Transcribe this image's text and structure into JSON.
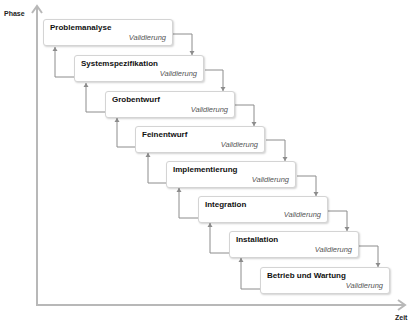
{
  "axes": {
    "y_label": "Phase",
    "x_label": "Zeit",
    "color": "#b3b3b3"
  },
  "connector_color": "#8c8c8c",
  "phases": [
    {
      "title": "Problemanalyse",
      "subtitle": "Validierung"
    },
    {
      "title": "Systemspezifikation",
      "subtitle": "Validierung"
    },
    {
      "title": "Grobentwurf",
      "subtitle": "Validierung"
    },
    {
      "title": "Feinentwurf",
      "subtitle": "Validierung"
    },
    {
      "title": "Implementierung",
      "subtitle": "Validierung"
    },
    {
      "title": "Integration",
      "subtitle": "Validierung"
    },
    {
      "title": "Installation",
      "subtitle": "Validierung"
    },
    {
      "title": "Betrieb und Wartung",
      "subtitle": "Validierung"
    }
  ]
}
